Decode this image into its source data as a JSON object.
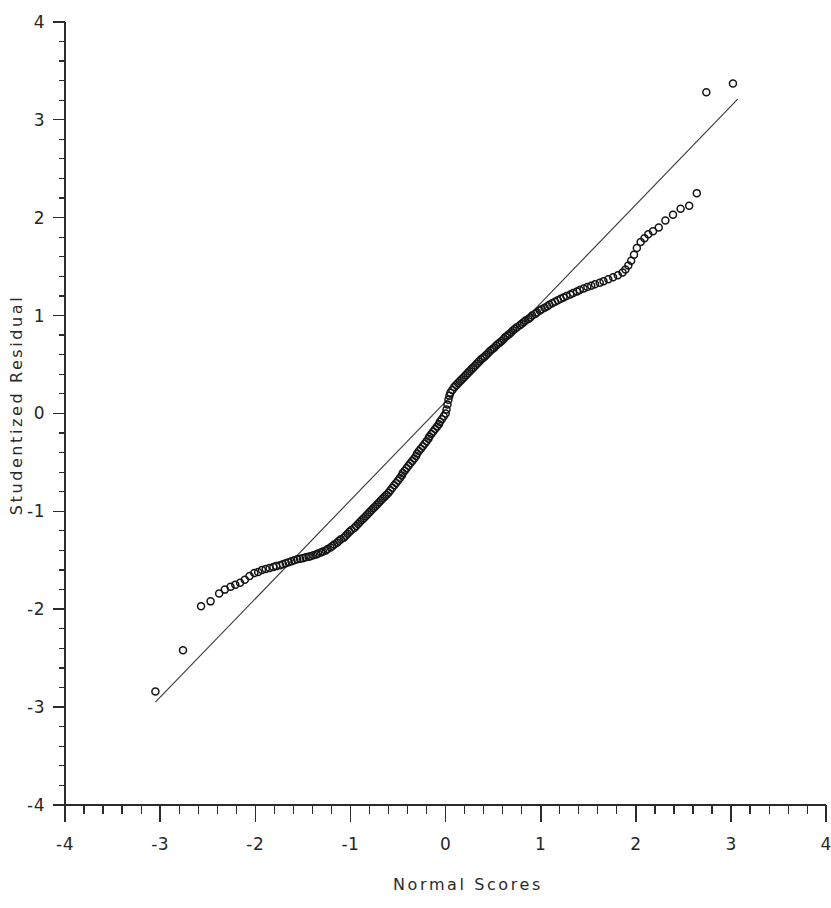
{
  "chart_data": {
    "type": "scatter",
    "title": "",
    "subtitle": "",
    "xlabel": "Normal Scores",
    "ylabel": "Studentized Residual",
    "xlim": [
      -4,
      4
    ],
    "ylim": [
      -4,
      4
    ],
    "grid": false,
    "legend": null,
    "x_ticks": [
      -4,
      -3,
      -2,
      -1,
      0,
      1,
      2,
      3,
      4
    ],
    "y_ticks": [
      -4,
      -3,
      -2,
      -1,
      0,
      1,
      2,
      3,
      4
    ],
    "x_tick_labels": [
      "-4",
      "-3",
      "-2",
      "-1",
      "0",
      "1",
      "2",
      "3",
      "4"
    ],
    "y_tick_labels": [
      "-4",
      "-3",
      "-2",
      "-1",
      "0",
      "1",
      "2",
      "3",
      "4"
    ],
    "minor_tick_interval": 0.2,
    "marker": "open-circle",
    "marker_size_px": 7,
    "series": [
      {
        "name": "Q-Q points",
        "points": [
          [
            -3.05,
            -2.84
          ],
          [
            -2.76,
            -2.42
          ],
          [
            -2.57,
            -1.97
          ],
          [
            -2.47,
            -1.92
          ],
          [
            -2.38,
            -1.84
          ],
          [
            -2.32,
            -1.8
          ],
          [
            -2.26,
            -1.77
          ],
          [
            -2.21,
            -1.75
          ],
          [
            -2.16,
            -1.73
          ],
          [
            -2.11,
            -1.7
          ],
          [
            -2.06,
            -1.66
          ],
          [
            -2.01,
            -1.63
          ],
          [
            -1.97,
            -1.62
          ],
          [
            -1.93,
            -1.6
          ],
          [
            -1.89,
            -1.59
          ],
          [
            -1.85,
            -1.58
          ],
          [
            -1.81,
            -1.57
          ],
          [
            -1.78,
            -1.56
          ],
          [
            -1.74,
            -1.55
          ],
          [
            -1.71,
            -1.54
          ],
          [
            -1.68,
            -1.53
          ],
          [
            -1.65,
            -1.52
          ],
          [
            -1.62,
            -1.51
          ],
          [
            -1.59,
            -1.5
          ],
          [
            -1.56,
            -1.49
          ],
          [
            -1.53,
            -1.485
          ],
          [
            -1.5,
            -1.48
          ],
          [
            -1.47,
            -1.47
          ],
          [
            -1.44,
            -1.465
          ],
          [
            -1.42,
            -1.46
          ],
          [
            -1.39,
            -1.45
          ],
          [
            -1.36,
            -1.44
          ],
          [
            -1.34,
            -1.43
          ],
          [
            -1.31,
            -1.42
          ],
          [
            -1.29,
            -1.41
          ],
          [
            -1.26,
            -1.4
          ],
          [
            -1.24,
            -1.385
          ],
          [
            -1.21,
            -1.37
          ],
          [
            -1.19,
            -1.355
          ],
          [
            -1.17,
            -1.34
          ],
          [
            -1.14,
            -1.32
          ],
          [
            -1.12,
            -1.3
          ],
          [
            -1.1,
            -1.285
          ],
          [
            -1.07,
            -1.27
          ],
          [
            -1.05,
            -1.25
          ],
          [
            -1.03,
            -1.23
          ],
          [
            -1.01,
            -1.21
          ],
          [
            -0.99,
            -1.19
          ],
          [
            -0.96,
            -1.17
          ],
          [
            -0.94,
            -1.15
          ],
          [
            -0.92,
            -1.13
          ],
          [
            -0.9,
            -1.11
          ],
          [
            -0.88,
            -1.09
          ],
          [
            -0.86,
            -1.07
          ],
          [
            -0.84,
            -1.05
          ],
          [
            -0.82,
            -1.03
          ],
          [
            -0.8,
            -1.01
          ],
          [
            -0.78,
            -0.99
          ],
          [
            -0.76,
            -0.97
          ],
          [
            -0.74,
            -0.95
          ],
          [
            -0.72,
            -0.93
          ],
          [
            -0.7,
            -0.91
          ],
          [
            -0.68,
            -0.89
          ],
          [
            -0.66,
            -0.87
          ],
          [
            -0.64,
            -0.85
          ],
          [
            -0.62,
            -0.83
          ],
          [
            -0.6,
            -0.81
          ],
          [
            -0.58,
            -0.785
          ],
          [
            -0.56,
            -0.76
          ],
          [
            -0.54,
            -0.735
          ],
          [
            -0.52,
            -0.71
          ],
          [
            -0.5,
            -0.685
          ],
          [
            -0.48,
            -0.66
          ],
          [
            -0.46,
            -0.635
          ],
          [
            -0.45,
            -0.61
          ],
          [
            -0.43,
            -0.585
          ],
          [
            -0.41,
            -0.56
          ],
          [
            -0.39,
            -0.535
          ],
          [
            -0.37,
            -0.51
          ],
          [
            -0.35,
            -0.485
          ],
          [
            -0.33,
            -0.46
          ],
          [
            -0.31,
            -0.435
          ],
          [
            -0.3,
            -0.41
          ],
          [
            -0.28,
            -0.385
          ],
          [
            -0.26,
            -0.36
          ],
          [
            -0.24,
            -0.335
          ],
          [
            -0.22,
            -0.31
          ],
          [
            -0.2,
            -0.285
          ],
          [
            -0.18,
            -0.26
          ],
          [
            -0.17,
            -0.235
          ],
          [
            -0.15,
            -0.21
          ],
          [
            -0.13,
            -0.185
          ],
          [
            -0.11,
            -0.16
          ],
          [
            -0.09,
            -0.135
          ],
          [
            -0.07,
            -0.11
          ],
          [
            -0.06,
            -0.085
          ],
          [
            -0.04,
            -0.06
          ],
          [
            -0.02,
            -0.03
          ],
          [
            0.0,
            0.0
          ],
          [
            0.01,
            0.04
          ],
          [
            0.02,
            0.09
          ],
          [
            0.03,
            0.14
          ],
          [
            0.04,
            0.18
          ],
          [
            0.05,
            0.21
          ],
          [
            0.07,
            0.24
          ],
          [
            0.09,
            0.27
          ],
          [
            0.11,
            0.29
          ],
          [
            0.13,
            0.31
          ],
          [
            0.15,
            0.33
          ],
          [
            0.17,
            0.35
          ],
          [
            0.19,
            0.37
          ],
          [
            0.21,
            0.39
          ],
          [
            0.23,
            0.41
          ],
          [
            0.25,
            0.43
          ],
          [
            0.27,
            0.45
          ],
          [
            0.29,
            0.47
          ],
          [
            0.31,
            0.49
          ],
          [
            0.33,
            0.51
          ],
          [
            0.35,
            0.53
          ],
          [
            0.37,
            0.55
          ],
          [
            0.39,
            0.565
          ],
          [
            0.41,
            0.58
          ],
          [
            0.43,
            0.6
          ],
          [
            0.45,
            0.62
          ],
          [
            0.47,
            0.64
          ],
          [
            0.49,
            0.655
          ],
          [
            0.51,
            0.67
          ],
          [
            0.53,
            0.69
          ],
          [
            0.55,
            0.71
          ],
          [
            0.57,
            0.725
          ],
          [
            0.59,
            0.74
          ],
          [
            0.61,
            0.76
          ],
          [
            0.63,
            0.78
          ],
          [
            0.65,
            0.795
          ],
          [
            0.67,
            0.81
          ],
          [
            0.69,
            0.83
          ],
          [
            0.71,
            0.85
          ],
          [
            0.73,
            0.865
          ],
          [
            0.75,
            0.88
          ],
          [
            0.78,
            0.9
          ],
          [
            0.8,
            0.915
          ],
          [
            0.82,
            0.93
          ],
          [
            0.84,
            0.95
          ],
          [
            0.87,
            0.965
          ],
          [
            0.89,
            0.98
          ],
          [
            0.91,
            1.0
          ],
          [
            0.94,
            1.015
          ],
          [
            0.96,
            1.03
          ],
          [
            0.99,
            1.05
          ],
          [
            1.01,
            1.065
          ],
          [
            1.04,
            1.08
          ],
          [
            1.07,
            1.095
          ],
          [
            1.09,
            1.11
          ],
          [
            1.12,
            1.125
          ],
          [
            1.15,
            1.14
          ],
          [
            1.18,
            1.155
          ],
          [
            1.21,
            1.17
          ],
          [
            1.24,
            1.185
          ],
          [
            1.27,
            1.2
          ],
          [
            1.31,
            1.215
          ],
          [
            1.34,
            1.23
          ],
          [
            1.38,
            1.245
          ],
          [
            1.41,
            1.26
          ],
          [
            1.45,
            1.275
          ],
          [
            1.49,
            1.29
          ],
          [
            1.53,
            1.305
          ],
          [
            1.57,
            1.32
          ],
          [
            1.62,
            1.335
          ],
          [
            1.66,
            1.35
          ],
          [
            1.71,
            1.37
          ],
          [
            1.76,
            1.39
          ],
          [
            1.81,
            1.41
          ],
          [
            1.86,
            1.44
          ],
          [
            1.89,
            1.47
          ],
          [
            1.92,
            1.51
          ],
          [
            1.95,
            1.56
          ],
          [
            1.98,
            1.62
          ],
          [
            2.01,
            1.69
          ],
          [
            2.05,
            1.75
          ],
          [
            2.09,
            1.79
          ],
          [
            2.13,
            1.83
          ],
          [
            2.18,
            1.86
          ],
          [
            2.24,
            1.9
          ],
          [
            2.31,
            1.97
          ],
          [
            2.39,
            2.03
          ],
          [
            2.47,
            2.09
          ],
          [
            2.56,
            2.12
          ],
          [
            2.64,
            2.25
          ],
          [
            2.74,
            3.28
          ],
          [
            3.02,
            3.37
          ]
        ]
      }
    ],
    "reference_line": {
      "name": "normal reference line",
      "x0": -3.05,
      "y0": -2.95,
      "x1": 3.07,
      "y1": 3.21
    }
  }
}
